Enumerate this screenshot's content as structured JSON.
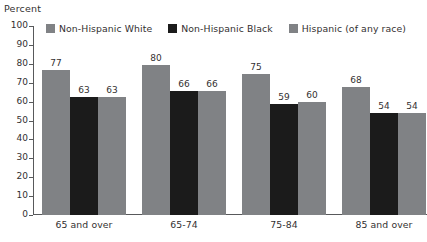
{
  "chart_data": {
    "type": "bar",
    "title": "",
    "subtitle": "",
    "xlabel": "",
    "ylabel": "Percent",
    "ylim": [
      0,
      100
    ],
    "ytick_step": 10,
    "yticks": [
      "100",
      "90",
      "80",
      "70",
      "60",
      "50",
      "40",
      "30",
      "20",
      "10",
      "0"
    ],
    "grid": false,
    "legend_position": "top",
    "categories": [
      "65 and over",
      "65-74",
      "75-84",
      "85 and over"
    ],
    "series": [
      {
        "name": "Non-Hispanic White",
        "color": "#808285",
        "values": [
          77,
          80,
          75,
          68
        ],
        "labels": [
          "77",
          "80",
          "75",
          "68"
        ]
      },
      {
        "name": "Non-Hispanic Black",
        "color": "#1b1b1b",
        "values": [
          63,
          66,
          59,
          54
        ],
        "labels": [
          "63",
          "66",
          "59",
          "54"
        ]
      },
      {
        "name": "Hispanic (of any race)",
        "color": "#808285",
        "values": [
          63,
          66,
          60,
          54
        ],
        "labels": [
          "63",
          "66",
          "60",
          "54"
        ]
      }
    ]
  },
  "axis": {
    "percent_label": "Percent"
  },
  "colors": {
    "gray_bar": "#808285",
    "black_bar": "#1b1b1b",
    "axis": "#58595b",
    "text": "#333031",
    "background": "#ffffff"
  }
}
